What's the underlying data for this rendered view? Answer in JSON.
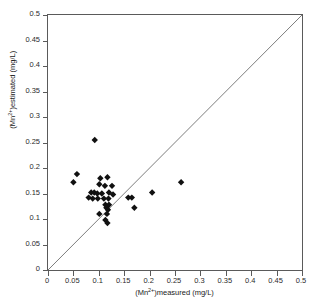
{
  "chart_data": {
    "type": "scatter",
    "title": "",
    "xlabel": "(Mn2+)measured (mg/L)",
    "ylabel": "(Mn2+)estimated (mg/L)",
    "xlabel_prefix": "(Mn",
    "xlabel_charge": "2+",
    "xlabel_suffix": ")measured (mg/L)",
    "ylabel_prefix": "(Mn",
    "ylabel_charge": "2+",
    "ylabel_suffix": ")estimated (mg/L)",
    "xlim": [
      0,
      0.5
    ],
    "ylim": [
      0,
      0.5
    ],
    "xticks": [
      0,
      0.05,
      0.1,
      0.15,
      0.2,
      0.25,
      0.3,
      0.35,
      0.4,
      0.45,
      0.5
    ],
    "yticks": [
      0,
      0.05,
      0.1,
      0.15,
      0.2,
      0.25,
      0.3,
      0.35,
      0.4,
      0.45,
      0.5
    ],
    "xtick_labels": [
      "0",
      "0.05",
      "0.1",
      "0.15",
      "0.2",
      "0.25",
      "0.3",
      "0.35",
      "0.4",
      "0.45",
      "0.5"
    ],
    "ytick_labels": [
      "0",
      "0.05",
      "0.1",
      "0.15",
      "0.2",
      "0.25",
      "0.3",
      "0.35",
      "0.4",
      "0.45",
      "0.5"
    ],
    "grid": false,
    "legend": null,
    "marker_color": "#111111",
    "marker_shape": "diamond",
    "marker_size": 3.2,
    "reference_line": {
      "name": "1:1 identity line",
      "from": [
        0,
        0
      ],
      "to": [
        0.5,
        0.5
      ],
      "color": "#6e6e6e"
    },
    "series": [
      {
        "name": "Mn samples",
        "points": [
          [
            0.092,
            0.255
          ],
          [
            0.057,
            0.188
          ],
          [
            0.05,
            0.172
          ],
          [
            0.103,
            0.18
          ],
          [
            0.117,
            0.182
          ],
          [
            0.101,
            0.168
          ],
          [
            0.112,
            0.165
          ],
          [
            0.126,
            0.165
          ],
          [
            0.085,
            0.152
          ],
          [
            0.091,
            0.152
          ],
          [
            0.097,
            0.15
          ],
          [
            0.106,
            0.15
          ],
          [
            0.12,
            0.152
          ],
          [
            0.128,
            0.148
          ],
          [
            0.08,
            0.142
          ],
          [
            0.088,
            0.14
          ],
          [
            0.098,
            0.14
          ],
          [
            0.11,
            0.14
          ],
          [
            0.119,
            0.14
          ],
          [
            0.158,
            0.142
          ],
          [
            0.165,
            0.142
          ],
          [
            0.205,
            0.152
          ],
          [
            0.262,
            0.172
          ],
          [
            0.113,
            0.128
          ],
          [
            0.12,
            0.128
          ],
          [
            0.115,
            0.122
          ],
          [
            0.118,
            0.118
          ],
          [
            0.17,
            0.122
          ],
          [
            0.101,
            0.11
          ],
          [
            0.116,
            0.11
          ],
          [
            0.113,
            0.098
          ],
          [
            0.117,
            0.092
          ]
        ]
      }
    ]
  }
}
